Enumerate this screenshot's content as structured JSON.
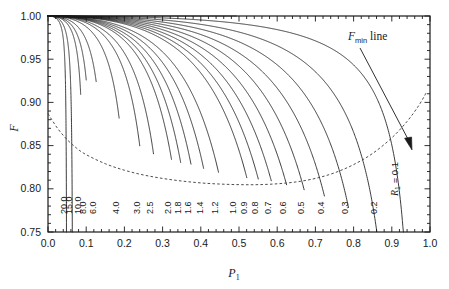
{
  "chart_data": {
    "type": "line",
    "title": "",
    "xlabel": "P_1",
    "xlabel_base": "P",
    "xlabel_sub": "1",
    "ylabel": "F",
    "xlim": [
      0.0,
      1.0
    ],
    "ylim": [
      0.75,
      1.0
    ],
    "grid": false,
    "legend_position": "inline-curve-labels",
    "xticks": [
      "0.0",
      "0.1",
      "0.2",
      "0.3",
      "0.4",
      "0.5",
      "0.6",
      "0.7",
      "0.8",
      "0.9",
      "1.0"
    ],
    "xtick_values": [
      0.0,
      0.1,
      0.2,
      0.3,
      0.4,
      0.5,
      0.6,
      0.7,
      0.8,
      0.9,
      1.0
    ],
    "yticks": [
      "0.75",
      "0.80",
      "0.85",
      "0.90",
      "0.95",
      "1.00"
    ],
    "ytick_values": [
      0.75,
      0.8,
      0.85,
      0.9,
      0.95,
      1.0
    ],
    "minor_tick_count": 5,
    "annotations": [
      {
        "id": "fmin-annotation",
        "text_italic": "F",
        "text_sub": "min",
        "text_plain": " line",
        "text": "F_min line",
        "x_px": 348,
        "y_px": 38,
        "arrow_from": [
          360,
          46
        ],
        "arrow_to": [
          411,
          146
        ]
      },
      {
        "id": "r1-annotation",
        "text_italic": "R",
        "text_sub": "1",
        "text_plain": " = 0.1",
        "text": "R_1 = 0.1",
        "rotated": true
      }
    ],
    "series_parameter_name": "R_1",
    "series": [
      {
        "name": "20.0",
        "R": 20.0,
        "x_end": 0.0495,
        "label_x": 0.0495
      },
      {
        "name": "15.0",
        "R": 15.0,
        "x_end": 0.064,
        "label_x": 0.064
      },
      {
        "name": "10.0",
        "R": 10.0,
        "x_end": 0.0855,
        "label_x": 0.0855
      },
      {
        "name": "8.0",
        "R": 8.0,
        "x_end": 0.1,
        "label_x": 0.1
      },
      {
        "name": "6.0",
        "R": 6.0,
        "x_end": 0.126,
        "label_x": 0.126
      },
      {
        "name": "4.0",
        "R": 4.0,
        "x_end": 0.186,
        "label_x": 0.186
      },
      {
        "name": "3.0",
        "R": 3.0,
        "x_end": 0.24,
        "label_x": 0.24
      },
      {
        "name": "2.5",
        "R": 2.5,
        "x_end": 0.276,
        "label_x": 0.276
      },
      {
        "name": "2.0",
        "R": 2.0,
        "x_end": 0.323,
        "label_x": 0.323
      },
      {
        "name": "1.8",
        "R": 1.8,
        "x_end": 0.347,
        "label_x": 0.347
      },
      {
        "name": "1.6",
        "R": 1.6,
        "x_end": 0.374,
        "label_x": 0.374
      },
      {
        "name": "1.4",
        "R": 1.4,
        "x_end": 0.407,
        "label_x": 0.407
      },
      {
        "name": "1.2",
        "R": 1.2,
        "x_end": 0.446,
        "label_x": 0.446
      },
      {
        "name": "1.0",
        "R": 1.0,
        "x_end": 0.493,
        "label_x": 0.493
      },
      {
        "name": "0.9",
        "R": 0.9,
        "x_end": 0.52,
        "label_x": 0.52
      },
      {
        "name": "0.8",
        "R": 0.8,
        "x_end": 0.55,
        "label_x": 0.55
      },
      {
        "name": "0.7",
        "R": 0.7,
        "x_end": 0.584,
        "label_x": 0.584
      },
      {
        "name": "0.6",
        "R": 0.6,
        "x_end": 0.624,
        "label_x": 0.624
      },
      {
        "name": "0.5",
        "R": 0.5,
        "x_end": 0.67,
        "label_x": 0.67
      },
      {
        "name": "0.4",
        "R": 0.4,
        "x_end": 0.723,
        "label_x": 0.723
      },
      {
        "name": "0.3",
        "R": 0.3,
        "x_end": 0.786,
        "label_x": 0.786
      },
      {
        "name": "0.2",
        "R": 0.2,
        "x_end": 0.86,
        "label_x": 0.86
      },
      {
        "name": "0.1",
        "R": 0.1,
        "x_end": 0.95,
        "label_x": 0.948
      }
    ],
    "fmin_curve": {
      "name": "F_min line",
      "style": "dashed",
      "points": [
        [
          0.0,
          0.887
        ],
        [
          0.025,
          0.87
        ],
        [
          0.05,
          0.857
        ],
        [
          0.075,
          0.847
        ],
        [
          0.1,
          0.8395
        ],
        [
          0.15,
          0.829
        ],
        [
          0.2,
          0.8215
        ],
        [
          0.25,
          0.816
        ],
        [
          0.3,
          0.812
        ],
        [
          0.35,
          0.809
        ],
        [
          0.4,
          0.8068
        ],
        [
          0.45,
          0.8055
        ],
        [
          0.5,
          0.8048
        ],
        [
          0.55,
          0.8048
        ],
        [
          0.6,
          0.8058
        ],
        [
          0.65,
          0.808
        ],
        [
          0.7,
          0.812
        ],
        [
          0.75,
          0.8185
        ],
        [
          0.8,
          0.828
        ],
        [
          0.85,
          0.841
        ],
        [
          0.9,
          0.859
        ],
        [
          0.94,
          0.878
        ],
        [
          0.97,
          0.896
        ],
        [
          0.99,
          0.911
        ]
      ]
    }
  }
}
